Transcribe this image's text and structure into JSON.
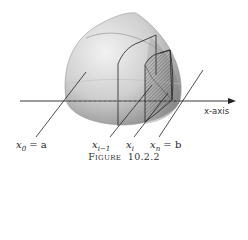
{
  "figure": {
    "caption_prefix": "Figure",
    "caption_number": "10.2.2",
    "axis_label": "x-axis",
    "labels": {
      "x0_base": "x",
      "x0_sub": "0",
      "x0_rest": " = a",
      "xim1_base": "x",
      "xim1_sub": "i−1",
      "xi_base": "x",
      "xi_sub": "i",
      "xn_base": "x",
      "xn_sub": "n",
      "xn_rest": " = b"
    },
    "colors": {
      "solid_light": "#e8e8e8",
      "solid_dark": "#8a8a8a",
      "lines": "#222222",
      "hatch": "#555555"
    }
  }
}
